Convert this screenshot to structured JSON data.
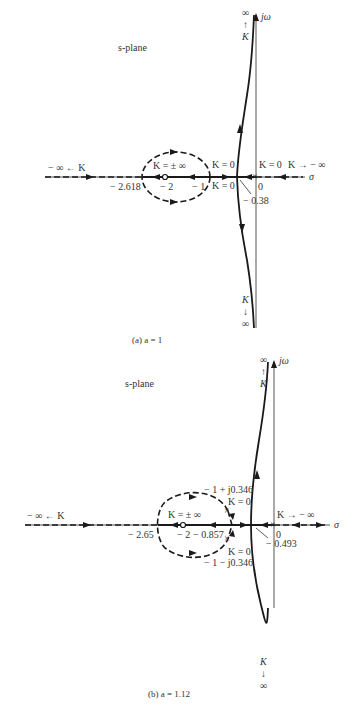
{
  "figure_a": {
    "plane_label": "s-plane",
    "imag_axis_label": "jω",
    "real_axis_label": "σ",
    "top_label": [
      "∞",
      "↑",
      "K"
    ],
    "bottom_label": [
      "K",
      "↓",
      "∞"
    ],
    "left_label": "− ∞ ← K",
    "right_label": "K → − ∞",
    "k_inf_label": "K = ± ∞",
    "k0_upper": "K = 0",
    "k0_lower": "K = 0",
    "k0_origin": "K = 0",
    "ticks": {
      "breakaway": "− 2.618",
      "zero": "− 2",
      "pole1": "− 1",
      "pole2": "− 0.38",
      "origin": "0"
    },
    "caption": "(a) a = 1"
  },
  "figure_b": {
    "plane_label": "s-plane",
    "imag_axis_label": "jω",
    "real_axis_label": "σ",
    "top_label": [
      "∞",
      "↑",
      "K"
    ],
    "bottom_label": [
      "K",
      "↓",
      "∞"
    ],
    "left_label": "− ∞ ← K",
    "right_label": "K → − ∞",
    "k_inf_label": "K = ± ∞",
    "upper_pole_label": "− 1 + j0.346",
    "upper_pole_k": "K = 0",
    "lower_pole_label": "− 1 − j0.346",
    "lower_pole_k": "K = 0",
    "k0_origin": "K = 0",
    "ticks": {
      "breakaway": "− 2.65",
      "zero": "− 2",
      "point": "− 0.857",
      "pole": "− 0.493",
      "origin": "0"
    },
    "caption": "(b) a = 1.12"
  }
}
